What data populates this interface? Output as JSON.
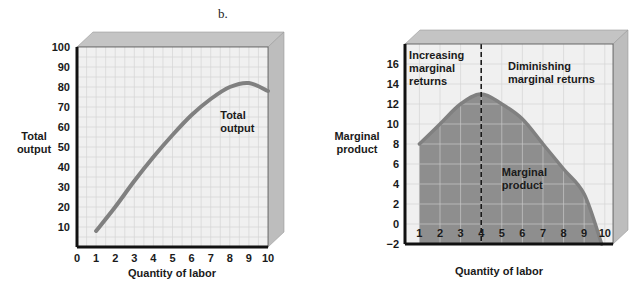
{
  "panel_label": "b.",
  "colors": {
    "plot_bg": "#f0f0f0",
    "grid": "#d4d4d4",
    "box_top": "#c4c4c4",
    "box_side": "#bdbdbd",
    "frame": "#111111",
    "curve": "#808080",
    "fill": "#8e8e8e",
    "fill_grid": "#c8c8c8"
  },
  "chart_data": [
    {
      "type": "line",
      "title": "",
      "xlabel": "Quantity of labor",
      "ylabel": "Total output",
      "xlim": [
        0,
        10
      ],
      "ylim": [
        0,
        100
      ],
      "xticks": [
        "0",
        "1",
        "2",
        "3",
        "4",
        "5",
        "6",
        "7",
        "8",
        "9",
        "10"
      ],
      "yticks": [
        "10",
        "20",
        "30",
        "40",
        "50",
        "60",
        "70",
        "80",
        "90",
        "100"
      ],
      "grid": true,
      "series": [
        {
          "name": "Total output",
          "x": [
            1,
            2,
            3,
            4,
            5,
            6,
            7,
            8,
            9,
            10
          ],
          "values": [
            8,
            20,
            33,
            45,
            56,
            66,
            74,
            80,
            82,
            78
          ]
        }
      ],
      "annotations": [
        {
          "text_lines": [
            "Total",
            "output"
          ],
          "x": 7.5,
          "y": 64
        }
      ]
    },
    {
      "type": "area",
      "title": "",
      "xlabel": "Quantity of labor",
      "ylabel": "Marginal product",
      "xlim": [
        0.3,
        10.4
      ],
      "ylim": [
        -2,
        18
      ],
      "xticks": [
        "1",
        "2",
        "3",
        "4",
        "5",
        "6",
        "7",
        "8",
        "9",
        "10"
      ],
      "yticks": [
        "16",
        "14",
        "12",
        "10",
        "8",
        "6",
        "4",
        "2",
        "0",
        "−2"
      ],
      "grid": true,
      "series": [
        {
          "name": "Marginal product",
          "x": [
            1,
            2,
            3,
            4,
            5,
            6,
            7,
            8,
            9,
            9.85
          ],
          "values": [
            8,
            10,
            12,
            13,
            12,
            10.5,
            8,
            5.5,
            3,
            -2
          ]
        }
      ],
      "divider": {
        "x": 4,
        "style": "dashed"
      },
      "annotations": [
        {
          "text_lines": [
            "Increasing",
            "marginal",
            "returns"
          ],
          "x": 0.5,
          "y": 16.5
        },
        {
          "text_lines": [
            "Diminishing",
            "marginal returns"
          ],
          "x": 5.3,
          "y": 15.4
        },
        {
          "text_lines": [
            "Marginal",
            "product"
          ],
          "x": 5.0,
          "y": 4.8
        }
      ]
    }
  ]
}
